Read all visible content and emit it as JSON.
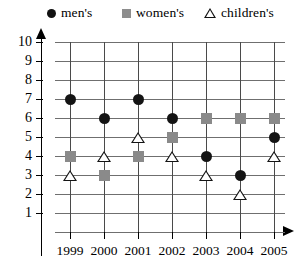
{
  "legend": {
    "entries": [
      {
        "label": "men's",
        "marker": "filled-circle-icon",
        "color": "#141414"
      },
      {
        "label": "women's",
        "marker": "filled-square-icon",
        "color": "#8a8a8a"
      },
      {
        "label": "children's",
        "marker": "open-triangle-icon",
        "color": "#141414"
      }
    ]
  },
  "chart_data": {
    "type": "scatter",
    "title": "",
    "xlabel": "",
    "ylabel": "",
    "categories": [
      "1999",
      "2000",
      "2001",
      "2002",
      "2003",
      "2004",
      "2005"
    ],
    "x": [
      1999,
      2000,
      2001,
      2002,
      2003,
      2004,
      2005
    ],
    "series": [
      {
        "name": "men's",
        "marker": "filled-circle",
        "color": "#141414",
        "values": [
          7,
          6,
          7,
          6,
          4,
          3,
          5
        ]
      },
      {
        "name": "women's",
        "marker": "filled-square",
        "color": "#8a8a8a",
        "values": [
          4,
          3,
          4,
          5,
          6,
          6,
          6
        ]
      },
      {
        "name": "children's",
        "marker": "open-triangle",
        "color": "#141414",
        "values": [
          3,
          4,
          5,
          4,
          3,
          2,
          4
        ]
      }
    ],
    "ylim": [
      0,
      10
    ],
    "ytick_labels": [
      "10",
      "9",
      "8",
      "7",
      "6",
      "5",
      "4",
      "3",
      "2",
      "1"
    ],
    "yticks": [
      10,
      9,
      8,
      7,
      6,
      5,
      4,
      3,
      2,
      1
    ],
    "xlim": [
      1998.5,
      2005.5
    ],
    "grid": true,
    "legend_position": "top"
  }
}
